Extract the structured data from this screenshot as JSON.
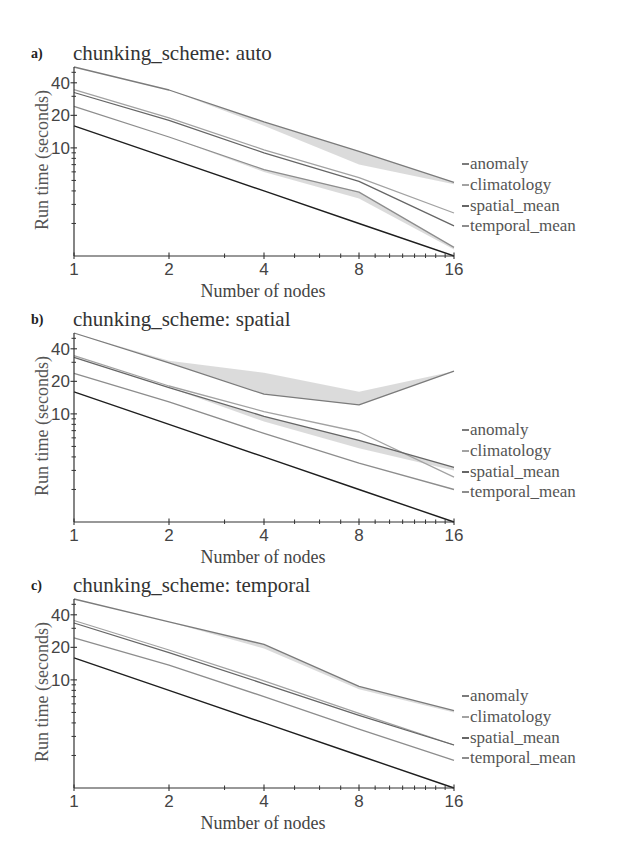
{
  "figure": {
    "panels": [
      {
        "label": "a)",
        "title": "chunking_scheme: auto",
        "ylabel": "Run time (seconds)",
        "xlabel": "Number of nodes",
        "legend": [
          "anomaly",
          "climatology",
          "spatial_mean",
          "temporal_mean"
        ]
      },
      {
        "label": "b)",
        "title": "chunking_scheme: spatial",
        "ylabel": "Run time (seconds)",
        "xlabel": "Number of nodes",
        "legend": [
          "anomaly",
          "climatology",
          "spatial_mean",
          "temporal_mean"
        ]
      },
      {
        "label": "c)",
        "title": "chunking_scheme: temporal",
        "ylabel": "Run time (seconds)",
        "xlabel": "Number of nodes",
        "legend": [
          "anomaly",
          "climatology",
          "spatial_mean",
          "temporal_mean"
        ]
      }
    ]
  },
  "colors": {
    "anomaly": "#7b7b7b",
    "climatology": "#a2a2a2",
    "spatial_mean": "#666666",
    "temporal_mean": "#8d8d8d",
    "ideal": "#1e1e1e",
    "band": "#cfcfcf",
    "axis": "#333333"
  },
  "chart_data": [
    {
      "type": "line",
      "title": "chunking_scheme: auto",
      "xlabel": "Number of nodes",
      "ylabel": "Run time (seconds)",
      "xscale": "log2",
      "yscale": "log",
      "x": [
        1,
        2,
        4,
        8,
        16
      ],
      "xlim": [
        1,
        16
      ],
      "ylim": [
        1,
        56
      ],
      "xticks": [
        1,
        2,
        4,
        8,
        16
      ],
      "xtick_labels": [
        "1",
        "2",
        "4",
        "8",
        "16"
      ],
      "xminor": [
        3,
        5,
        6,
        7,
        9,
        10,
        11,
        12,
        13,
        14,
        15
      ],
      "yticks": [
        10,
        20,
        40
      ],
      "ytick_labels": [
        "10",
        "20",
        "40"
      ],
      "yminor": [
        2,
        3,
        4,
        5,
        6,
        7,
        8,
        9,
        30,
        50
      ],
      "grid": false,
      "legend_position": "right",
      "series": [
        {
          "name": "anomaly",
          "values": [
            56,
            34.3,
            17.4,
            9.3,
            4.8
          ],
          "band_lower": [
            56,
            34.3,
            16.0,
            7.0,
            4.6
          ]
        },
        {
          "name": "climatology",
          "values": [
            34.6,
            19.0,
            9.6,
            5.3,
            2.5
          ]
        },
        {
          "name": "spatial_mean",
          "values": [
            32.5,
            18.0,
            9.0,
            4.9,
            1.9
          ]
        },
        {
          "name": "temporal_mean",
          "values": [
            24.2,
            12.6,
            6.3,
            3.9,
            1.2
          ],
          "band_lower": [
            24.2,
            12.6,
            6.0,
            3.4,
            1.15
          ]
        },
        {
          "name": "ideal",
          "values": [
            16,
            8,
            4,
            2,
            1
          ],
          "in_legend": false
        }
      ]
    },
    {
      "type": "line",
      "title": "chunking_scheme: spatial",
      "xlabel": "Number of nodes",
      "ylabel": "Run time (seconds)",
      "xscale": "log2",
      "yscale": "log",
      "x": [
        1,
        2,
        4,
        8,
        16
      ],
      "xlim": [
        1,
        16
      ],
      "ylim": [
        1,
        56
      ],
      "xticks": [
        1,
        2,
        4,
        8,
        16
      ],
      "xtick_labels": [
        "1",
        "2",
        "4",
        "8",
        "16"
      ],
      "xminor": [
        3,
        5,
        6,
        7,
        9,
        10,
        11,
        12,
        13,
        14,
        15
      ],
      "yticks": [
        10,
        20,
        40
      ],
      "ytick_labels": [
        "10",
        "20",
        "40"
      ],
      "yminor": [
        2,
        3,
        4,
        5,
        6,
        7,
        8,
        9,
        30,
        50
      ],
      "grid": false,
      "legend_position": "right",
      "series": [
        {
          "name": "anomaly",
          "values": [
            56,
            29.6,
            15.2,
            12.1,
            24.8
          ],
          "band_upper": [
            56,
            31,
            24,
            16,
            24.8
          ]
        },
        {
          "name": "climatology",
          "values": [
            34.6,
            18.1,
            10.5,
            6.8,
            2.6
          ]
        },
        {
          "name": "spatial_mean",
          "values": [
            33.3,
            17.5,
            9.5,
            5.7,
            3.2
          ],
          "band_lower": [
            33.3,
            17.5,
            8.5,
            4.8,
            3.0
          ]
        },
        {
          "name": "temporal_mean",
          "values": [
            23.7,
            12.9,
            6.6,
            3.5,
            2.0
          ]
        },
        {
          "name": "ideal",
          "values": [
            16,
            8,
            4,
            2,
            1
          ],
          "in_legend": false
        }
      ]
    },
    {
      "type": "line",
      "title": "chunking_scheme: temporal",
      "xlabel": "Number of nodes",
      "ylabel": "Run time (seconds)",
      "xscale": "log2",
      "yscale": "log",
      "x": [
        1,
        2,
        4,
        8,
        16
      ],
      "xlim": [
        1,
        16
      ],
      "ylim": [
        1,
        56
      ],
      "xticks": [
        1,
        2,
        4,
        8,
        16
      ],
      "xtick_labels": [
        "1",
        "2",
        "4",
        "8",
        "16"
      ],
      "xminor": [
        3,
        5,
        6,
        7,
        9,
        10,
        11,
        12,
        13,
        14,
        15
      ],
      "yticks": [
        10,
        20,
        40
      ],
      "ytick_labels": [
        "10",
        "20",
        "40"
      ],
      "yminor": [
        2,
        3,
        4,
        5,
        6,
        7,
        8,
        9,
        30,
        50
      ],
      "grid": false,
      "legend_position": "right",
      "series": [
        {
          "name": "anomaly",
          "values": [
            56,
            34.4,
            21.3,
            8.7,
            5.2
          ],
          "band_lower": [
            56,
            34.4,
            19.5,
            8.2,
            5.0
          ]
        },
        {
          "name": "climatology",
          "values": [
            35.4,
            18.9,
            9.8,
            4.9,
            2.5
          ]
        },
        {
          "name": "spatial_mean",
          "values": [
            33.6,
            17.9,
            9.2,
            4.7,
            2.5
          ]
        },
        {
          "name": "temporal_mean",
          "values": [
            24.5,
            13.7,
            7.0,
            3.5,
            1.8
          ]
        },
        {
          "name": "ideal",
          "values": [
            16,
            8,
            4,
            2,
            1
          ],
          "in_legend": false
        }
      ]
    }
  ]
}
